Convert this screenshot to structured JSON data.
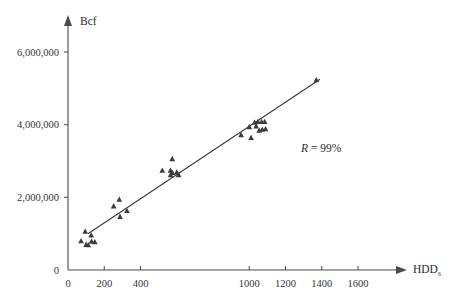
{
  "chart_data": {
    "type": "scatter",
    "title": "",
    "xlabel": "HDDs",
    "xlabel_base": "HDD",
    "xlabel_subscript": "s",
    "ylabel": "Bcf",
    "xlim": [
      0,
      1800
    ],
    "ylim": [
      0,
      6600000
    ],
    "grid": false,
    "legend": "none",
    "x_ticks": [
      0,
      200,
      400,
      1000,
      1200,
      1400,
      1600
    ],
    "x_tick_labels": [
      "0",
      "200",
      "400",
      "1000",
      "1200",
      "1400",
      "1600"
    ],
    "y_ticks": [
      0,
      2000000,
      4000000,
      6000000
    ],
    "y_tick_labels": [
      "0",
      "2,000,000",
      "4,000,000",
      "6,000,000"
    ],
    "marker": "triangle",
    "marker_color": "#3b3b43",
    "annotations": [
      {
        "name": "correlation",
        "text": "R = 99%",
        "r_symbol": "R",
        "equals": " = ",
        "value": "99%",
        "x": 1330,
        "y": 3060000
      }
    ],
    "trend_line": {
      "x_start": 110,
      "y_start": 1000000,
      "x_end": 1390,
      "y_end": 5250000,
      "color": "#3a3a42"
    },
    "points": [
      {
        "x": 72,
        "y": 800000
      },
      {
        "x": 95,
        "y": 1060000
      },
      {
        "x": 100,
        "y": 700000
      },
      {
        "x": 112,
        "y": 690000
      },
      {
        "x": 128,
        "y": 960000
      },
      {
        "x": 130,
        "y": 790000
      },
      {
        "x": 148,
        "y": 770000
      },
      {
        "x": 252,
        "y": 1760000
      },
      {
        "x": 283,
        "y": 1940000
      },
      {
        "x": 287,
        "y": 1470000
      },
      {
        "x": 325,
        "y": 1630000
      },
      {
        "x": 520,
        "y": 2740000
      },
      {
        "x": 565,
        "y": 2740000
      },
      {
        "x": 566,
        "y": 2620000
      },
      {
        "x": 575,
        "y": 3060000
      },
      {
        "x": 576,
        "y": 2680000
      },
      {
        "x": 600,
        "y": 2690000
      },
      {
        "x": 610,
        "y": 2620000
      },
      {
        "x": 955,
        "y": 3720000
      },
      {
        "x": 1000,
        "y": 3940000
      },
      {
        "x": 1010,
        "y": 3640000
      },
      {
        "x": 1030,
        "y": 4060000
      },
      {
        "x": 1038,
        "y": 3960000
      },
      {
        "x": 1048,
        "y": 4080000
      },
      {
        "x": 1055,
        "y": 3840000
      },
      {
        "x": 1068,
        "y": 4080000
      },
      {
        "x": 1072,
        "y": 3870000
      },
      {
        "x": 1085,
        "y": 4080000
      },
      {
        "x": 1090,
        "y": 3880000
      },
      {
        "x": 1370,
        "y": 5230000
      }
    ]
  }
}
